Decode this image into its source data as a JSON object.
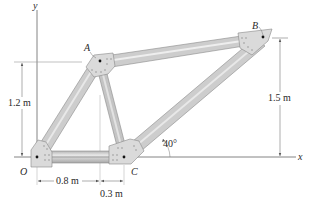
{
  "figure": {
    "type": "truss-frame",
    "axes": {
      "x_label": "x",
      "y_label": "y"
    },
    "joints": [
      {
        "id": "O",
        "label": "O",
        "x": 40,
        "y": 157
      },
      {
        "id": "A",
        "label": "A",
        "x": 100,
        "y": 61
      },
      {
        "id": "B",
        "label": "B",
        "x": 263,
        "y": 37
      },
      {
        "id": "C",
        "label": "C",
        "x": 124,
        "y": 157
      }
    ],
    "members": [
      {
        "name": "OA",
        "from": "O",
        "to": "A"
      },
      {
        "name": "OC",
        "from": "O",
        "to": "C"
      },
      {
        "name": "AC",
        "from": "A",
        "to": "C"
      },
      {
        "name": "AB",
        "from": "A",
        "to": "B"
      },
      {
        "name": "CB",
        "from": "C",
        "to": "B"
      }
    ],
    "dimensions": {
      "height_A": "1.2 m",
      "height_B": "1.5 m",
      "horiz_OA": "0.8 m",
      "horiz_AC": "0.3 m",
      "angle_CB": "40°"
    },
    "colors": {
      "member_fill": "#c9c9c9",
      "member_highlight": "#e6e6e6",
      "member_edge": "#8a8a8a",
      "gusset_fill": "#dcdcdc",
      "axis_line": "#555555",
      "dim_line": "#777777"
    }
  }
}
